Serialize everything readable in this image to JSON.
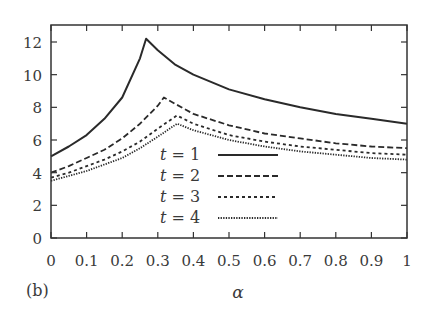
{
  "panel_label": "(b)",
  "chart_data": {
    "type": "line",
    "title": "",
    "xlabel": "α",
    "ylabel": "",
    "xlim": [
      0,
      1
    ],
    "ylim": [
      0,
      13
    ],
    "grid": false,
    "legend_position": "center, inside plot",
    "x_ticks": [
      "0",
      "0.1",
      "0.2",
      "0.3",
      "0.4",
      "0.5",
      "0.6",
      "0.7",
      "0.8",
      "0.9",
      "1"
    ],
    "y_ticks": [
      "0",
      "2",
      "4",
      "6",
      "8",
      "10",
      "12"
    ],
    "x": [
      0,
      0.05,
      0.1,
      0.15,
      0.2,
      0.25,
      0.267,
      0.3,
      0.317,
      0.35,
      0.354,
      0.4,
      0.5,
      0.6,
      0.7,
      0.8,
      0.9,
      1.0
    ],
    "series": [
      {
        "name": "t = 1",
        "style": "solid",
        "points": [
          [
            0,
            5.0
          ],
          [
            0.05,
            5.6
          ],
          [
            0.1,
            6.3
          ],
          [
            0.15,
            7.3
          ],
          [
            0.2,
            8.6
          ],
          [
            0.25,
            11.0
          ],
          [
            0.267,
            12.2
          ],
          [
            0.3,
            11.5
          ],
          [
            0.35,
            10.6
          ],
          [
            0.4,
            10.0
          ],
          [
            0.5,
            9.1
          ],
          [
            0.6,
            8.5
          ],
          [
            0.7,
            8.0
          ],
          [
            0.8,
            7.6
          ],
          [
            0.9,
            7.3
          ],
          [
            1.0,
            7.0
          ]
        ]
      },
      {
        "name": "t = 2",
        "style": "dashed",
        "points": [
          [
            0,
            4.0
          ],
          [
            0.05,
            4.4
          ],
          [
            0.1,
            4.9
          ],
          [
            0.15,
            5.4
          ],
          [
            0.2,
            6.1
          ],
          [
            0.25,
            7.0
          ],
          [
            0.3,
            8.1
          ],
          [
            0.317,
            8.6
          ],
          [
            0.35,
            8.2
          ],
          [
            0.4,
            7.6
          ],
          [
            0.5,
            6.9
          ],
          [
            0.6,
            6.4
          ],
          [
            0.7,
            6.1
          ],
          [
            0.8,
            5.8
          ],
          [
            0.9,
            5.6
          ],
          [
            1.0,
            5.5
          ]
        ]
      },
      {
        "name": "t = 3",
        "style": "dotted-sparse",
        "points": [
          [
            0,
            3.7
          ],
          [
            0.05,
            4.0
          ],
          [
            0.1,
            4.4
          ],
          [
            0.15,
            4.8
          ],
          [
            0.2,
            5.3
          ],
          [
            0.25,
            5.9
          ],
          [
            0.3,
            6.7
          ],
          [
            0.354,
            7.5
          ],
          [
            0.4,
            7.0
          ],
          [
            0.5,
            6.3
          ],
          [
            0.6,
            5.9
          ],
          [
            0.7,
            5.6
          ],
          [
            0.8,
            5.4
          ],
          [
            0.9,
            5.2
          ],
          [
            1.0,
            5.1
          ]
        ]
      },
      {
        "name": "t = 4",
        "style": "dotted-dense",
        "points": [
          [
            0,
            3.5
          ],
          [
            0.05,
            3.8
          ],
          [
            0.1,
            4.1
          ],
          [
            0.15,
            4.5
          ],
          [
            0.2,
            4.9
          ],
          [
            0.25,
            5.5
          ],
          [
            0.3,
            6.2
          ],
          [
            0.354,
            7.0
          ],
          [
            0.4,
            6.6
          ],
          [
            0.5,
            6.0
          ],
          [
            0.6,
            5.6
          ],
          [
            0.7,
            5.3
          ],
          [
            0.8,
            5.1
          ],
          [
            0.9,
            4.9
          ],
          [
            1.0,
            4.8
          ]
        ]
      }
    ]
  },
  "legend": {
    "items": [
      {
        "label_var": "t",
        "label_eq": " = 1",
        "style": "solid"
      },
      {
        "label_var": "t",
        "label_eq": " = 2",
        "style": "dashed"
      },
      {
        "label_var": "t",
        "label_eq": " = 3",
        "style": "dotted-sparse"
      },
      {
        "label_var": "t",
        "label_eq": " = 4",
        "style": "dotted-dense"
      }
    ]
  },
  "colors": {
    "line": "#2a2a2a",
    "axis": "#333333",
    "text": "#3a3a3a",
    "background": "#ffffff"
  }
}
